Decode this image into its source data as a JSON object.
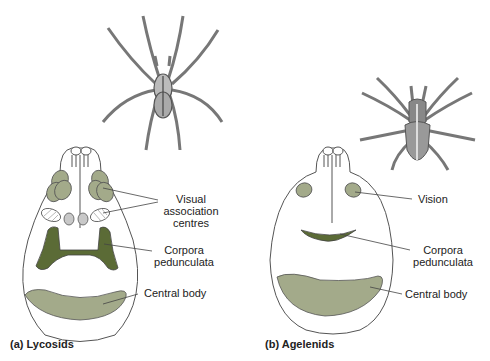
{
  "colors": {
    "outline": "#555555",
    "light_green": "#a3aa8a",
    "dark_green": "#5b6b36",
    "grey_oval": "#c8c8c8",
    "spider_grey": "#a0a0a0"
  },
  "panel_a": {
    "caption": "(a) Lycosids",
    "labels": {
      "visual_association": [
        "Visual",
        "association",
        "centres"
      ],
      "corpora": [
        "Corpora",
        "pedunculata"
      ],
      "central_body": "Central body"
    }
  },
  "panel_b": {
    "caption": "(b) Agelenids",
    "labels": {
      "vision": "Vision",
      "corpora": [
        "Corpora",
        "pedunculata"
      ],
      "central_body": "Central body"
    }
  }
}
